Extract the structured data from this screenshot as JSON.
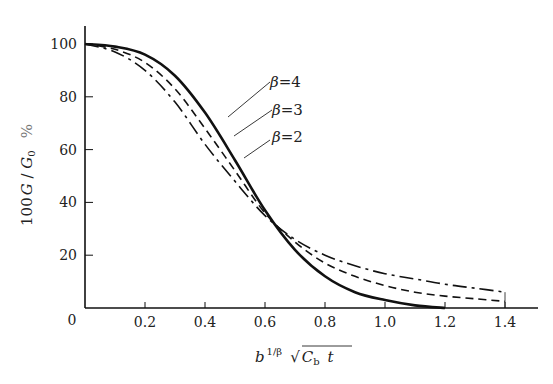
{
  "chart_data": {
    "type": "line",
    "title": "",
    "xlabel": "b^{1/β} √(C_b t)",
    "ylabel": "100 G / G_0  %",
    "xlim": [
      0,
      1.5
    ],
    "ylim": [
      0,
      105
    ],
    "x_ticks": [
      0.2,
      0.4,
      0.6,
      0.8,
      1.0,
      1.2,
      1.4
    ],
    "x_tick_labels": [
      "0.2",
      "0.4",
      "0.6",
      "0.8",
      "1.0",
      "1.2",
      "1.4"
    ],
    "y_ticks": [
      20,
      40,
      60,
      80,
      100
    ],
    "y_tick_labels": [
      "20",
      "40",
      "60",
      "80",
      "100"
    ],
    "origin_label": "0",
    "grid": false,
    "legend": "inline annotations with leader lines",
    "series": [
      {
        "name": "β=4",
        "style": "solid",
        "x": [
          0,
          0.1,
          0.2,
          0.3,
          0.4,
          0.5,
          0.6,
          0.7,
          0.8,
          0.9,
          1.0,
          1.1,
          1.2
        ],
        "y": [
          100,
          99,
          96,
          88,
          74,
          56,
          37,
          22,
          12,
          6,
          3,
          1,
          0
        ]
      },
      {
        "name": "β=3",
        "style": "dashed",
        "x": [
          0,
          0.1,
          0.2,
          0.3,
          0.4,
          0.5,
          0.6,
          0.7,
          0.8,
          0.9,
          1.0,
          1.1,
          1.2,
          1.3,
          1.4
        ],
        "y": [
          100,
          98,
          93,
          83,
          68,
          52,
          36,
          25,
          17,
          12,
          8.5,
          6,
          4.5,
          3.5,
          2.5
        ]
      },
      {
        "name": "β=2",
        "style": "dash-dot",
        "x": [
          0,
          0.1,
          0.2,
          0.3,
          0.4,
          0.5,
          0.6,
          0.7,
          0.8,
          0.9,
          1.0,
          1.1,
          1.2,
          1.3,
          1.4
        ],
        "y": [
          100,
          97,
          90,
          78,
          62,
          48,
          35,
          26,
          20,
          16,
          13,
          11,
          9,
          7.5,
          6
        ]
      }
    ],
    "annotations": [
      {
        "text": "β=4",
        "points_to": [
          0.42,
          70
        ]
      },
      {
        "text": "β=3",
        "points_to": [
          0.38,
          68
        ]
      },
      {
        "text": "β=2",
        "points_to": [
          0.42,
          57
        ]
      }
    ]
  },
  "labels": {
    "origin": "0",
    "y_axis": {
      "prefix": "100",
      "G": "G",
      "slash": " / ",
      "G0": "G",
      "sub0": "0",
      "unit": "%"
    },
    "x_axis": {
      "b": "b",
      "exp": "1/β",
      "C": "C",
      "sub_b": "b",
      "t": "t"
    },
    "beta4": "β=4",
    "beta3": "β=3",
    "beta2": "β=2"
  }
}
